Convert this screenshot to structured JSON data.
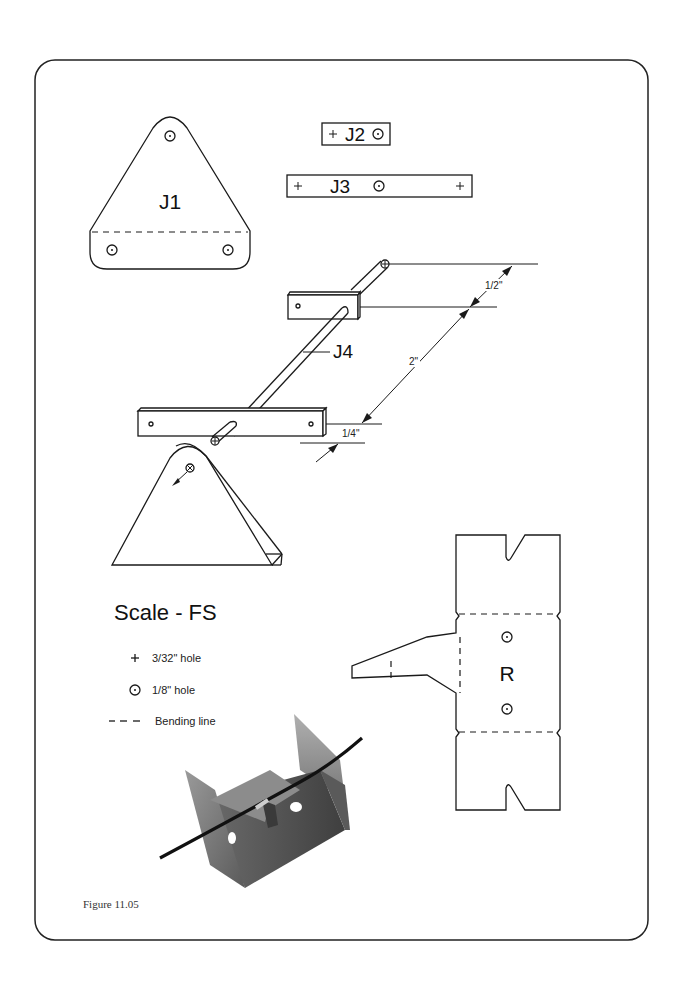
{
  "figure": {
    "caption": "Figure 11.05",
    "scale_title": "Scale - FS"
  },
  "parts": {
    "j1": {
      "label": "J1"
    },
    "j2": {
      "label": "J2"
    },
    "j3": {
      "label": "J3"
    },
    "j4": {
      "label": "J4"
    },
    "r": {
      "label": "R"
    }
  },
  "dimensions": {
    "half_inch": "1/2\"",
    "two_inch": "2\"",
    "quarter_inch": "1/4\""
  },
  "legend": {
    "items": [
      {
        "icon": "plus-icon",
        "symbol": "+",
        "label": "3/32\" hole"
      },
      {
        "icon": "circle-dot-icon",
        "symbol": "⊙",
        "label": "1/8\" hole"
      },
      {
        "icon": "dashed-line-icon",
        "symbol": "- - -",
        "label": "Bending line"
      }
    ]
  },
  "photo": {
    "description": "metal bracket with wire rod",
    "colors": {
      "metal_dark": "#4a4a4a",
      "metal_mid": "#7a7a7a",
      "metal_light": "#a8a8a8",
      "rod": "#111111"
    }
  },
  "colors": {
    "ink": "#1a1a1a",
    "background": "#ffffff"
  }
}
